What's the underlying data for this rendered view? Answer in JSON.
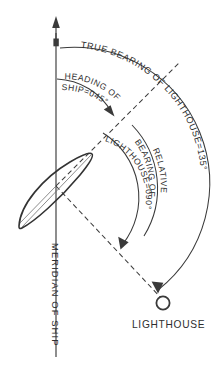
{
  "figure": {
    "background_color": "#ffffff",
    "ink_color": "#3a3a3a"
  },
  "labels": {
    "true_bearing": "TRUE BEARING OF LIGHTHOUSE=135°",
    "heading_line1": "HEADING OF",
    "heading_line2": "SHIP=045°",
    "relative_bearing_line1": "RELATIVE",
    "relative_bearing_line2": "BEARING OF",
    "relative_bearing_line3": "LIGHTHOUSE=090°",
    "meridian": "MERIDIAN OF SHIP",
    "lighthouse": "LIGHTHOUSE"
  },
  "values": {
    "true_bearing_deg": "135°",
    "heading_deg": "045°",
    "relative_bearing_deg": "090°"
  },
  "elements": {
    "north_arrow": "north-arrow-icon",
    "ship": "ship-icon",
    "lighthouse_marker": "lighthouse-circle-icon"
  }
}
